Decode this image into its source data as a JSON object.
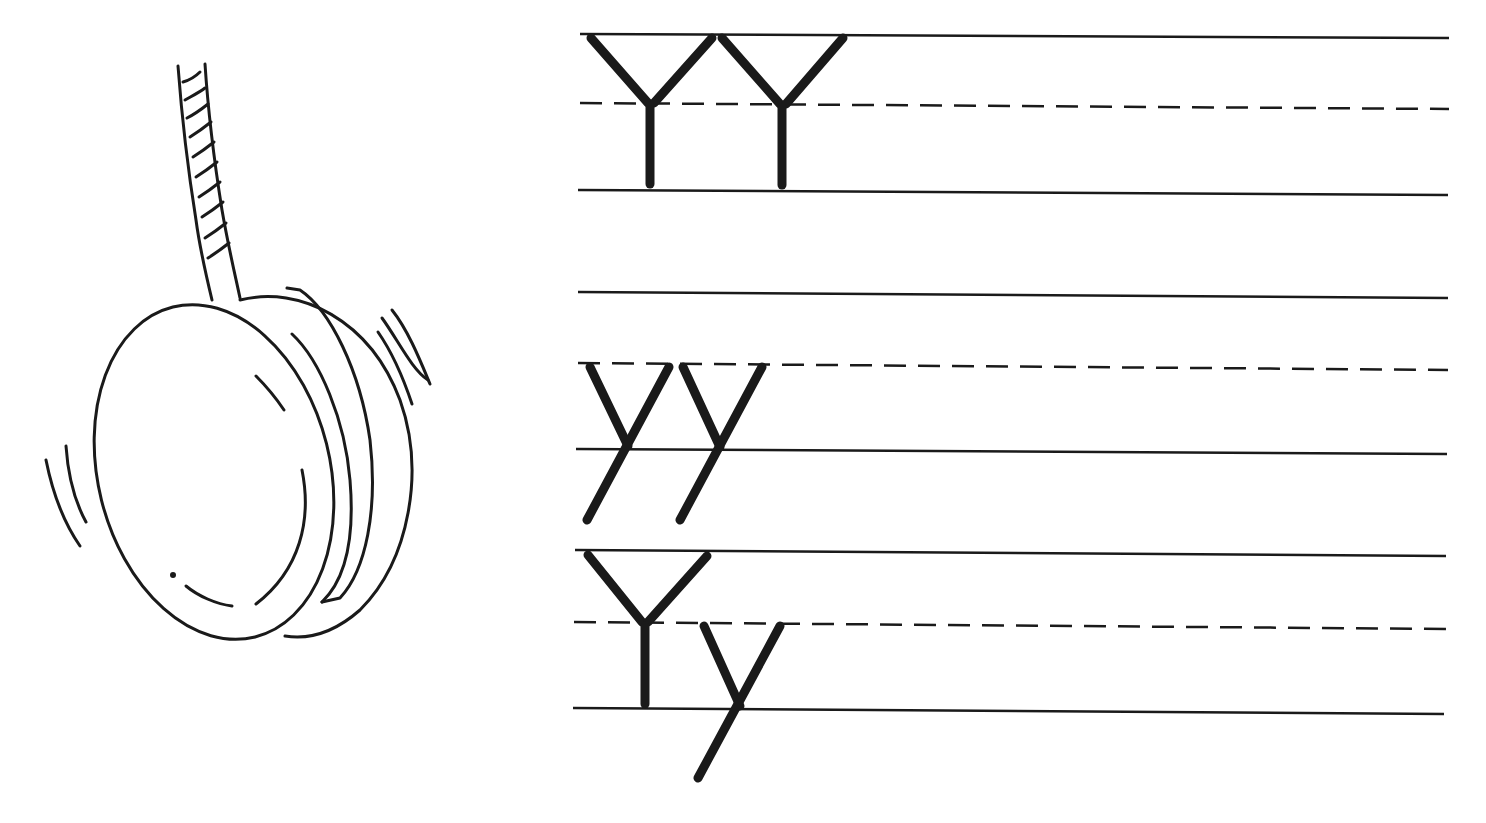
{
  "worksheet": {
    "letter_upper": "Y",
    "letter_lower": "y",
    "picture": "yo-yo",
    "rows": [
      {
        "id": "row-uppercase",
        "letters": [
          "Y",
          "Y"
        ]
      },
      {
        "id": "row-lowercase",
        "letters": [
          "y",
          "y"
        ]
      },
      {
        "id": "row-mixed",
        "letters": [
          "Y",
          "y"
        ]
      }
    ],
    "colors": {
      "ink": "#1a1a1a",
      "paper": "#ffffff"
    }
  }
}
